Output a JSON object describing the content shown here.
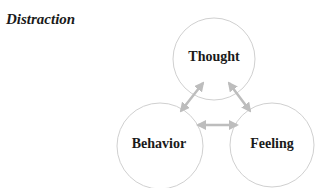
{
  "section": {
    "title": "Distraction"
  },
  "diagram": {
    "type": "cycle",
    "nodes": [
      {
        "id": "thought",
        "label": "Thought",
        "cx": 214,
        "cy": 59,
        "r": 41
      },
      {
        "id": "behavior",
        "label": "Behavior",
        "cx": 160,
        "cy": 146,
        "r": 43
      },
      {
        "id": "feeling",
        "label": "Feeling",
        "cx": 272,
        "cy": 145,
        "r": 42
      }
    ],
    "edges": [
      {
        "from": "thought",
        "to": "behavior",
        "bidirectional": true
      },
      {
        "from": "thought",
        "to": "feeling",
        "bidirectional": true
      },
      {
        "from": "behavior",
        "to": "feeling",
        "bidirectional": true
      }
    ],
    "colors": {
      "circle_stroke": "#d0d0d0",
      "arrow": "#bdbdbd",
      "text": "#1a1a1a"
    }
  }
}
